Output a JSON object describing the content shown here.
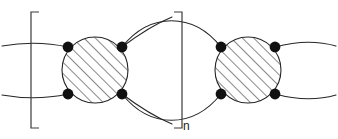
{
  "figure": {
    "kind": "chemical-structure-diagram",
    "canvas": {
      "width": 338,
      "height": 139,
      "background": "#ffffff"
    },
    "stroke_color": "#262626",
    "stroke_width": 1.1,
    "dot_color": "#111111",
    "hatch_color": "#262626",
    "repeat_subscript": "n",
    "units": [
      {
        "name": "monomer-unit-left",
        "cx": 95,
        "cy": 70,
        "r": 33
      },
      {
        "name": "monomer-unit-right",
        "cx": 248,
        "cy": 70,
        "r": 33
      }
    ],
    "vertex_dots": [
      {
        "name": "vertex-dot-left-nw",
        "cx": 68,
        "cy": 47,
        "r": 5.4
      },
      {
        "name": "vertex-dot-left-ne",
        "cx": 122,
        "cy": 47,
        "r": 5.4
      },
      {
        "name": "vertex-dot-left-sw",
        "cx": 68,
        "cy": 94,
        "r": 5.4
      },
      {
        "name": "vertex-dot-left-se",
        "cx": 122,
        "cy": 94,
        "r": 5.4
      },
      {
        "name": "vertex-dot-right-nw",
        "cx": 221,
        "cy": 47,
        "r": 5.4
      },
      {
        "name": "vertex-dot-right-ne",
        "cx": 275,
        "cy": 47,
        "r": 5.4
      },
      {
        "name": "vertex-dot-right-sw",
        "cx": 221,
        "cy": 94,
        "r": 5.4
      },
      {
        "name": "vertex-dot-right-se",
        "cx": 275,
        "cy": 94,
        "r": 5.4
      }
    ],
    "brackets": [
      {
        "name": "bracket-left",
        "side": "left",
        "x": 31,
        "arm": 8,
        "top": 12,
        "bottom": 128
      },
      {
        "name": "bracket-right",
        "side": "right",
        "x": 182,
        "arm": 8,
        "top": 12,
        "bottom": 128
      }
    ],
    "hatch": {
      "angle_deg": 45,
      "spacing_px": 8
    }
  }
}
